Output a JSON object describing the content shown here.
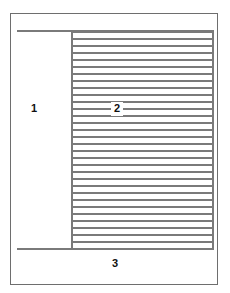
{
  "figure": {
    "kind": "patent-line-drawing",
    "caption_visible": false,
    "colors": {
      "background": "#ffffff",
      "frame_stroke": "#6e6e6e",
      "hatch_stroke": "#7a7a7a",
      "label_text": "#101010"
    },
    "frame": {
      "name": "outer-frame",
      "x": 10,
      "y": 13,
      "width": 208,
      "height": 272
    },
    "regions": [
      {
        "ref": "1",
        "description": "blank left region",
        "label_x": 31,
        "label_y": 103
      },
      {
        "ref": "2",
        "description": "hatched section region",
        "label_x": 111,
        "label_y": 102
      },
      {
        "ref": "3",
        "description": "lower blank region",
        "label_x": 112,
        "label_y": 258
      }
    ],
    "hatching": {
      "x": 73,
      "y": 31,
      "width": 139,
      "height": 218,
      "line_count": 31,
      "line_spacing": 7,
      "line_thickness": 2,
      "orientation": "horizontal"
    },
    "rules": [
      {
        "name": "line-top",
        "x": 17,
        "y": 30,
        "length": 197,
        "orientation": "horizontal"
      },
      {
        "name": "line-bottom",
        "x": 17,
        "y": 248,
        "length": 197,
        "orientation": "horizontal"
      },
      {
        "name": "line-vertical",
        "x": 71,
        "y": 30,
        "length": 220,
        "orientation": "vertical"
      },
      {
        "name": "line-vertical-right",
        "x": 212,
        "y": 30,
        "length": 220,
        "orientation": "vertical"
      }
    ],
    "labels": {
      "region_1": "1",
      "region_2": "2",
      "region_3": "3"
    }
  }
}
